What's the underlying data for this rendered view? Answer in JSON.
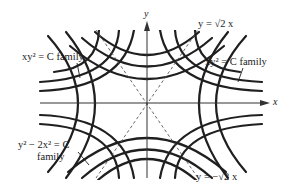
{
  "figure": {
    "axes": {
      "x_label": "x",
      "y_label": "y"
    },
    "asymptotes": [
      {
        "id": "pos",
        "equation": "y = √2 x",
        "text": "y = √2 x",
        "style": "dashed"
      },
      {
        "id": "neg",
        "equation": "y = −√2 x",
        "text": "y = −√2 x",
        "style": "dashed"
      }
    ],
    "families": [
      {
        "id": "xy2",
        "equation": "xy² = C",
        "text_left": "xy² = C family",
        "text_right": "xy² = C family",
        "label_prefix": "xy",
        "label_sup": "2",
        "label_suffix": " = C family"
      },
      {
        "id": "y2-2x2",
        "equation": "y² − 2x² = C",
        "text_line1": "y² − 2x² = C",
        "text_line2": "family",
        "parts": {
          "a": "y",
          "a_sup": "2",
          "mid": " − 2x",
          "b_sup": "2",
          "end": " = C"
        }
      }
    ],
    "colors": {
      "curve": "#1f1f1f",
      "axis": "#333333",
      "dashed": "#555555",
      "background": "#ffffff"
    }
  }
}
